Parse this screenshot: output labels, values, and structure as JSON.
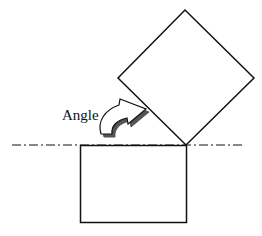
{
  "diagram": {
    "label": "Angle",
    "colors": {
      "stroke": "#111111",
      "background": "#ffffff",
      "arrow_fill": "#ffffff",
      "arrow_shadow": "#555555"
    },
    "shapes": {
      "reference_line": {
        "style": "dash-dot",
        "y": 145,
        "x_start": 12,
        "x_end": 245
      },
      "rectangle": {
        "x": 80,
        "y": 145,
        "width": 106,
        "height": 77
      },
      "rotated_square": {
        "vertices": [
          [
            185,
            10
          ],
          [
            254,
            78
          ],
          [
            185,
            145
          ],
          [
            118,
            78
          ]
        ]
      }
    }
  }
}
